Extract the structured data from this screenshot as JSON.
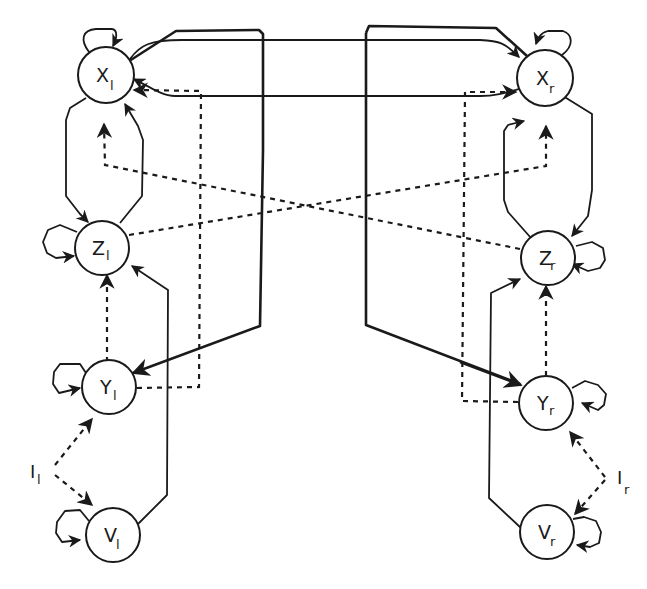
{
  "header": {
    "clipped_text": "..., ... ... ..., ...."
  },
  "diagram": {
    "type": "bilateral neural network (left/right) connectivity",
    "legend": {
      "solid_line": "excitatory / direct connection",
      "dashed_line": "secondary / inhibitory connection",
      "thick_line": "crossed connection"
    },
    "nodes": [
      {
        "id": "Xl",
        "label": "X",
        "sub": "l",
        "cx": 106,
        "cy": 75
      },
      {
        "id": "Xr",
        "label": "X",
        "sub": "r",
        "cx": 545,
        "cy": 78
      },
      {
        "id": "Zl",
        "label": "Z",
        "sub": "l",
        "cx": 102,
        "cy": 248
      },
      {
        "id": "Zr",
        "label": "Z",
        "sub": "r",
        "cx": 548,
        "cy": 258
      },
      {
        "id": "Yl",
        "label": "Y",
        "sub": "l",
        "cx": 109,
        "cy": 387
      },
      {
        "id": "Yr",
        "label": "Y",
        "sub": "r",
        "cx": 546,
        "cy": 403
      },
      {
        "id": "Vl",
        "label": "V",
        "sub": "l",
        "cx": 113,
        "cy": 535
      },
      {
        "id": "Vr",
        "label": "V",
        "sub": "r",
        "cx": 547,
        "cy": 532
      }
    ],
    "inputs": [
      {
        "id": "Il",
        "label": "I",
        "sub": "l",
        "targets": [
          "Yl",
          "Vl"
        ]
      },
      {
        "id": "Ir",
        "label": "I",
        "sub": "r",
        "targets": [
          "Yr",
          "Vr"
        ]
      }
    ],
    "edges": [
      {
        "from": "Xl",
        "to": "Xl",
        "style": "solid",
        "kind": "self-loop"
      },
      {
        "from": "Xr",
        "to": "Xr",
        "style": "solid",
        "kind": "self-loop"
      },
      {
        "from": "Zl",
        "to": "Zl",
        "style": "solid",
        "kind": "self-loop"
      },
      {
        "from": "Zr",
        "to": "Zr",
        "style": "solid",
        "kind": "self-loop"
      },
      {
        "from": "Yl",
        "to": "Yl",
        "style": "solid",
        "kind": "self-loop"
      },
      {
        "from": "Yr",
        "to": "Yr",
        "style": "solid",
        "kind": "self-loop"
      },
      {
        "from": "Vl",
        "to": "Vl",
        "style": "solid",
        "kind": "self-loop"
      },
      {
        "from": "Vr",
        "to": "Vr",
        "style": "solid",
        "kind": "self-loop"
      },
      {
        "from": "Xl",
        "to": "Zl",
        "style": "solid"
      },
      {
        "from": "Zl",
        "to": "Xl",
        "style": "solid"
      },
      {
        "from": "Xr",
        "to": "Zr",
        "style": "solid"
      },
      {
        "from": "Zr",
        "to": "Xr",
        "style": "solid"
      },
      {
        "from": "Xl",
        "to": "Xr",
        "style": "solid"
      },
      {
        "from": "Xr",
        "to": "Xl",
        "style": "solid"
      },
      {
        "from": "Xl",
        "to": "Yr",
        "style": "thick"
      },
      {
        "from": "Xr",
        "to": "Yl",
        "style": "thick"
      },
      {
        "from": "Yl",
        "to": "Zl",
        "style": "dashed"
      },
      {
        "from": "Yr",
        "to": "Zr",
        "style": "dashed"
      },
      {
        "from": "Yl",
        "to": "Xl",
        "style": "dashed"
      },
      {
        "from": "Yr",
        "to": "Xr",
        "style": "dashed"
      },
      {
        "from": "Zl",
        "to": "Xr",
        "style": "dashed"
      },
      {
        "from": "Zr",
        "to": "Xl",
        "style": "dashed"
      },
      {
        "from": "Vl",
        "to": "Zl",
        "style": "solid"
      },
      {
        "from": "Vr",
        "to": "Zr",
        "style": "solid"
      },
      {
        "from": "Il",
        "to": "Yl",
        "style": "dashed"
      },
      {
        "from": "Il",
        "to": "Vl",
        "style": "dashed"
      },
      {
        "from": "Ir",
        "to": "Yr",
        "style": "dashed"
      },
      {
        "from": "Ir",
        "to": "Vr",
        "style": "dashed"
      }
    ]
  },
  "colors": {
    "ink": "#1a1a1a",
    "background": "#ffffff"
  }
}
